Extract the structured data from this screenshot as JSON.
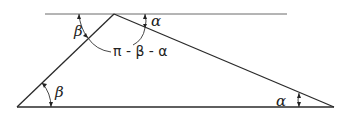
{
  "diagram": {
    "type": "triangle-angle-figure",
    "labels": {
      "beta_top": "β",
      "alpha_top": "α",
      "apex_angle": "π - β - α",
      "beta_bottom": "β",
      "alpha_bottom": "α"
    },
    "colors": {
      "stroke": "#2a2a2a",
      "reference_line": "#6a6a6a",
      "background": "#ffffff"
    }
  }
}
